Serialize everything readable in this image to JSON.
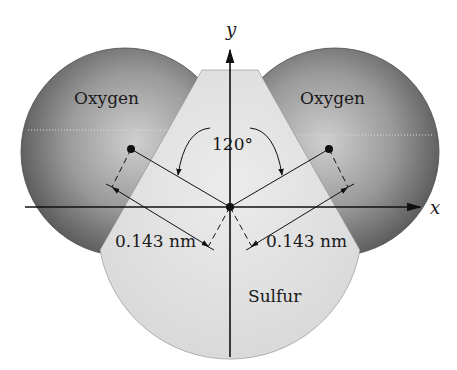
{
  "diagram": {
    "atoms": {
      "oxygen_left": {
        "label": "Oxygen"
      },
      "oxygen_right": {
        "label": "Oxygen"
      },
      "sulfur": {
        "label": "Sulfur"
      }
    },
    "axes": {
      "x_label": "x",
      "y_label": "y"
    },
    "angle": {
      "label": "120°"
    },
    "bond_lengths": {
      "left": "0.143 nm",
      "right": "0.143 nm"
    },
    "colors": {
      "oxygen_dark": "#5a5a5a",
      "oxygen_light": "#c8c8c8",
      "sulfur": "#e2e2e2",
      "ink": "#111111"
    }
  }
}
